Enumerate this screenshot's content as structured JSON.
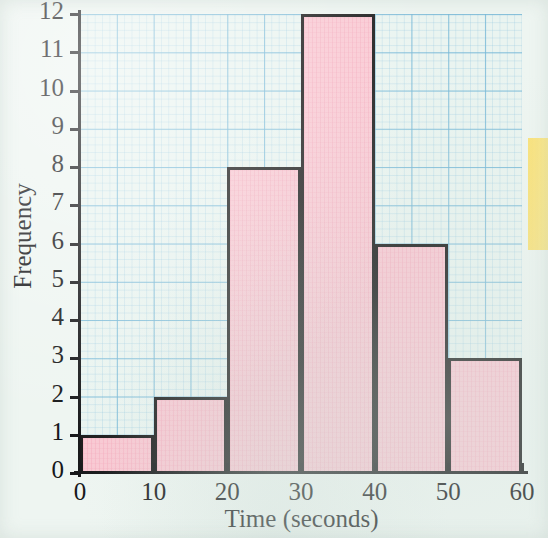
{
  "chart_data": {
    "type": "bar",
    "title": "",
    "subtitle": "",
    "xlabel": "Time (seconds)",
    "ylabel": "Frequency",
    "categories": [
      "0-10",
      "10-20",
      "20-30",
      "30-40",
      "40-50",
      "50-60"
    ],
    "bin_edges": [
      0,
      10,
      20,
      30,
      40,
      50,
      60
    ],
    "bin_width": 10,
    "values": [
      1,
      2,
      8,
      12,
      6,
      3
    ],
    "xlim": [
      0,
      60
    ],
    "ylim": [
      0,
      12
    ],
    "x_ticks": [
      "0",
      "10",
      "20",
      "30",
      "40",
      "50",
      "60"
    ],
    "y_ticks": [
      "0",
      "1",
      "2",
      "3",
      "4",
      "5",
      "6",
      "7",
      "8",
      "9",
      "10",
      "11",
      "12"
    ],
    "grid": true,
    "grid_color": "#78b9d7",
    "legend": "none",
    "bar_fill_color": "#f9c9d3",
    "bar_edge_color": "#1b1b1b",
    "background_color": "#eef5f1"
  },
  "annotations": {
    "sticky_note_color": "#fbe479",
    "sticky_note_label": ""
  }
}
